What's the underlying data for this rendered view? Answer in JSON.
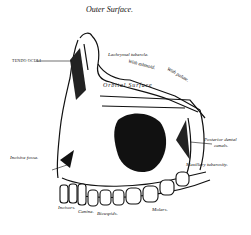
{
  "figure": {
    "subject": "maxilla",
    "labels": {
      "title": "Outer Surface.",
      "tendo_oculi": "TENDO OCULI",
      "lachrymal_tubercle": "Lachrymal tubercle.",
      "with_ethmoid": "With ethmoid.",
      "with_palate": "With palate.",
      "orbital_surface": "Orbital Surface",
      "orbital_groove": "Orbital groove",
      "antrum": "Antrum of Highmore",
      "posterior_dental_canals": "Posterior dental",
      "posterior_dental_canals_2": "canals.",
      "incisive_fossa": "Incisive fossa.",
      "maxillary_tuberosity": "Maxillary tuberosity.",
      "alveolar": "Alveolar process",
      "incisors": "Incisors.",
      "canine": "Canine.",
      "bicuspids": "Bicuspids.",
      "molars": "Molars."
    }
  }
}
